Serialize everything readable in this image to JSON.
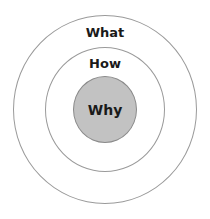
{
  "diagram": {
    "type": "concentric-circles",
    "circles": [
      {
        "label": "What",
        "level": "outer",
        "fill": "#ffffff",
        "stroke": "#9a9a9a"
      },
      {
        "label": "How",
        "level": "middle",
        "fill": "#ffffff",
        "stroke": "#9a9a9a"
      },
      {
        "label": "Why",
        "level": "inner",
        "fill": "#c2c2c2",
        "stroke": "#8a8a8a"
      }
    ]
  }
}
